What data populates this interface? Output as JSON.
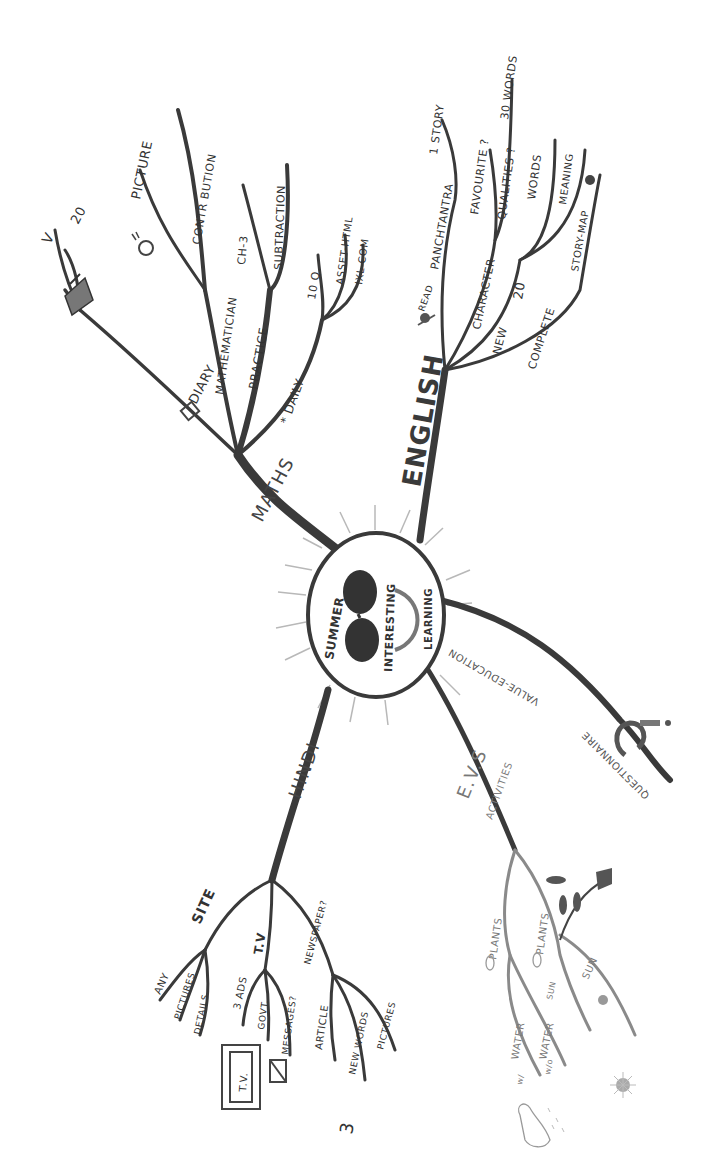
{
  "diagram": {
    "type": "hand-drawn mind map",
    "central_topic": {
      "lines": [
        "SUMMER",
        "INTERESTING",
        "LEARNING"
      ]
    },
    "branches": {
      "maths": {
        "label": "MATHS",
        "sub": {
          "diary": "DIARY",
          "v": "V",
          "twenty": "20",
          "mathematician": "MATHEMATICIAN",
          "picture": "PICTURE",
          "contribution": "CONTR BUTION",
          "practice": "PRACTICE",
          "ch3": "CH-3",
          "subtraction": "SUBTRACTION",
          "daily": "* DAILY",
          "ten_q": "10 Q.",
          "asset": "ASSET-HTML",
          "ixl": "IXL-COM"
        }
      },
      "english": {
        "label": "ENGLISH",
        "sub": {
          "read": "READ",
          "panchtantra": "PANCHTANTRA",
          "one_story": "1 STORY",
          "character": "CHARACTER",
          "favourite": "FAVOURITE ?",
          "qualities": "QUALITIES ?",
          "thirty_words": "30 WORDS",
          "new": "NEW",
          "twenty": "20",
          "words": "WORDS",
          "meaning": "MEANING",
          "complete": "COMPLETE",
          "story_map": "STORY-MAP"
        }
      },
      "hindi": {
        "label": "HINDI",
        "sub": {
          "site": "SITE",
          "any": "ANY",
          "pictures": "PICTURES",
          "details": "DETAILS",
          "tv": "T.V",
          "three_ads": "3 ADS",
          "govt": "GOVT.",
          "messages": "MESSAGES?",
          "newspaper": "NEWSPAPER?",
          "article": "ARTICLE",
          "new_words": "NEW WORDS",
          "pictures2": "PICTURES",
          "three": "3",
          "tv_box": "T.V."
        }
      },
      "evs": {
        "label": "E.V.S",
        "activities": "ACTIVITIES",
        "sub": {
          "plants_a": "PLANTS",
          "plants_b": "PLANTS",
          "water_1": "WATER",
          "water_2": "WATER",
          "sun_1": "SUN",
          "sun_2": "SUN",
          "with": "w/",
          "without": "w/o",
          "num_a": "1",
          "num_b": "2"
        }
      },
      "value_education": {
        "label": "VALUE-EDUCATION",
        "sub": {
          "questionnaire": "QUESTIONNAIRE"
        }
      }
    }
  }
}
